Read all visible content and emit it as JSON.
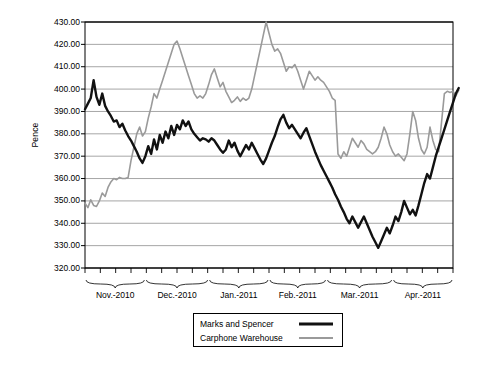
{
  "chart_data": {
    "type": "line",
    "title": "",
    "xlabel": "",
    "ylabel": "Pence",
    "ylim": [
      320,
      430
    ],
    "ytick_step": 10,
    "ytick_labels": [
      "430.00",
      "420.00",
      "410.00",
      "400.00",
      "390.00",
      "380.00",
      "370.00",
      "360.00",
      "350.00",
      "340.00",
      "330.00",
      "320.00"
    ],
    "grid": true,
    "legend_position": "bottom-center",
    "x_group_labels": [
      "Nov.-2010",
      "Dec.-2010",
      "Jan.-2011",
      "Feb.-2011",
      "Mar.-2011",
      "Apr.-2011"
    ],
    "x_group_spans": [
      [
        0,
        21
      ],
      [
        21,
        43
      ],
      [
        43,
        64
      ],
      [
        64,
        84
      ],
      [
        84,
        107
      ],
      [
        107,
        128
      ]
    ],
    "n_points": 129,
    "series": [
      {
        "name": "Marks and Spencer",
        "color": "#111111",
        "width": 2.4,
        "values": [
          391.0,
          393.5,
          396.0,
          404.0,
          396.5,
          393.0,
          398.0,
          392.5,
          390.0,
          388.0,
          385.5,
          386.0,
          383.0,
          384.5,
          381.5,
          379.0,
          377.0,
          374.5,
          372.0,
          369.0,
          367.0,
          370.0,
          374.5,
          371.0,
          377.5,
          373.0,
          379.5,
          376.0,
          381.0,
          378.0,
          383.5,
          379.5,
          384.0,
          382.0,
          386.0,
          383.5,
          385.5,
          382.0,
          380.0,
          378.5,
          377.0,
          378.0,
          377.5,
          376.5,
          378.0,
          377.0,
          375.0,
          373.0,
          371.5,
          373.0,
          377.0,
          374.0,
          376.0,
          372.5,
          370.0,
          372.5,
          375.0,
          373.0,
          376.0,
          373.5,
          371.0,
          368.5,
          366.5,
          369.0,
          372.5,
          376.0,
          379.0,
          383.0,
          386.5,
          388.5,
          385.0,
          382.5,
          384.0,
          382.0,
          380.0,
          378.0,
          380.5,
          382.5,
          379.0,
          375.5,
          372.0,
          369.0,
          366.0,
          363.5,
          361.0,
          358.5,
          356.0,
          353.0,
          350.5,
          347.5,
          345.0,
          342.0,
          340.0,
          343.0,
          340.5,
          338.0,
          340.5,
          343.0,
          340.0,
          337.0,
          334.0,
          331.5,
          329.0,
          332.0,
          335.0,
          338.0,
          335.5,
          339.0,
          343.0,
          341.0,
          345.0,
          350.0,
          347.0,
          344.0,
          346.0,
          343.5,
          348.0,
          353.0,
          358.0,
          362.0,
          360.0,
          365.0,
          370.0,
          374.0,
          378.0,
          382.0,
          386.0,
          390.0,
          394.0,
          398.0,
          400.5
        ]
      },
      {
        "name": "Carphone Warehouse",
        "color": "#9a9a9a",
        "width": 1.6,
        "values": [
          349.0,
          347.0,
          350.5,
          348.0,
          347.5,
          350.0,
          353.5,
          352.0,
          356.0,
          358.5,
          360.0,
          359.5,
          360.5,
          360.0,
          360.0,
          360.5,
          368.0,
          374.0,
          380.0,
          383.0,
          379.0,
          381.0,
          387.0,
          392.0,
          398.0,
          396.0,
          400.0,
          404.0,
          408.0,
          412.0,
          416.0,
          420.0,
          421.5,
          418.0,
          414.0,
          410.0,
          406.0,
          402.0,
          398.0,
          396.0,
          397.0,
          396.0,
          398.0,
          402.0,
          406.5,
          409.0,
          405.0,
          401.0,
          403.0,
          399.0,
          396.5,
          394.0,
          395.0,
          396.5,
          394.5,
          396.0,
          395.0,
          396.0,
          400.0,
          406.0,
          412.0,
          418.0,
          424.0,
          430.0,
          425.0,
          420.0,
          417.0,
          418.0,
          416.0,
          412.0,
          408.0,
          410.0,
          409.5,
          411.0,
          408.0,
          404.0,
          400.0,
          404.0,
          408.0,
          406.0,
          404.0,
          405.5,
          404.0,
          403.0,
          401.0,
          399.0,
          396.0,
          395.0,
          371.0,
          369.0,
          372.0,
          370.0,
          374.0,
          378.0,
          376.0,
          374.0,
          377.0,
          375.5,
          373.0,
          372.0,
          371.0,
          372.0,
          374.0,
          378.0,
          383.0,
          380.0,
          375.0,
          372.0,
          370.0,
          371.0,
          369.5,
          368.0,
          371.0,
          380.0,
          390.0,
          386.0,
          378.0,
          373.0,
          371.0,
          374.0,
          383.0,
          377.0,
          373.0,
          372.0,
          385.0,
          398.0,
          399.0,
          398.5,
          399.0,
          397.0,
          399.5
        ]
      }
    ]
  },
  "legend": {
    "items": [
      {
        "label": "Marks and Spencer"
      },
      {
        "label": "Carphone Warehouse"
      }
    ]
  }
}
